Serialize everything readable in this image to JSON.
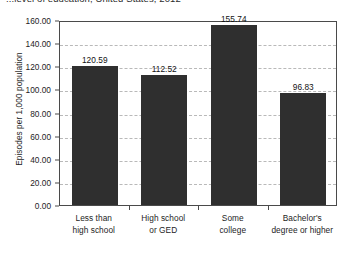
{
  "chart_data": {
    "type": "bar",
    "title": "...level of education, United States, 2012",
    "xlabel": "",
    "ylabel": "Episodes per 1,000 population",
    "categories": [
      "Less than high school",
      "High school or GED",
      "Some college",
      "Bachelor's degree or higher"
    ],
    "category_lines": [
      [
        "Less than",
        "high school"
      ],
      [
        "High school",
        "or GED"
      ],
      [
        "Some",
        "college"
      ],
      [
        "Bachelor's",
        "degree or higher"
      ]
    ],
    "values": [
      120.59,
      112.52,
      155.74,
      96.83
    ],
    "value_labels": [
      "120.59",
      "112.52",
      "155.74",
      "96.83"
    ],
    "ylim": [
      0,
      160
    ],
    "ytick_step": 20,
    "ytick_labels": [
      "160.00",
      "140.00",
      "120.00",
      "100.00",
      "80.00",
      "60.00",
      "40.00",
      "20.00",
      "0.00"
    ],
    "ytick_values": [
      160,
      140,
      120,
      100,
      80,
      60,
      40,
      20,
      0
    ],
    "grid": true,
    "grid_axis": "y",
    "legend": false,
    "colors": {
      "bar": "#2f2f2f",
      "grid": "#b9b9b9",
      "axis": "#4a4a4a",
      "text": "#1d1d1d",
      "background": "#ffffff"
    }
  }
}
